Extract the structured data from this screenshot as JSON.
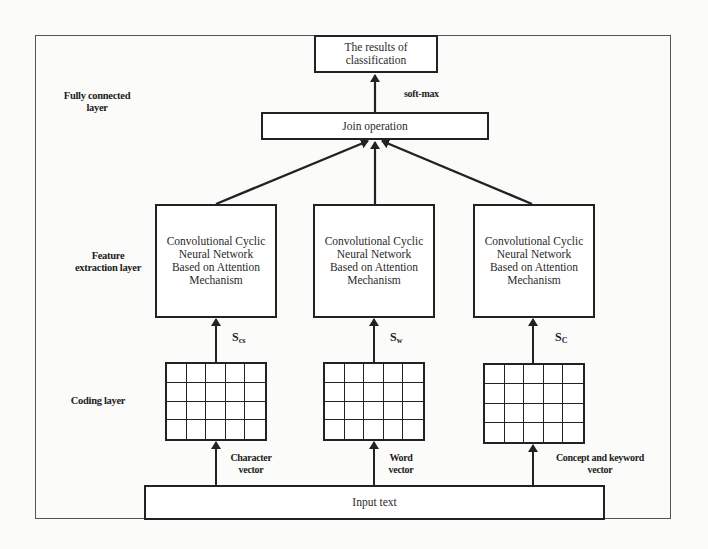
{
  "diagram": {
    "layers": {
      "fully_connected": "Fully connected layer",
      "feature_extraction": "Feature extraction layer",
      "coding": "Coding layer"
    },
    "layer_labels_lines": {
      "fully_connected": [
        "Fully connected",
        "layer"
      ],
      "feature_extraction": [
        "Feature",
        "extraction layer"
      ],
      "coding": [
        "Coding layer"
      ]
    },
    "output_box": {
      "lines": [
        "The results of",
        "classification"
      ]
    },
    "softmax_label": "soft-max",
    "join_box": {
      "label": "Join operation"
    },
    "cnn_boxes": [
      {
        "lines": [
          "Convolutional Cyclic",
          "Neural Network",
          "Based on Attention",
          "Mechanism"
        ],
        "symbol": "S",
        "symbol_sub": "cs"
      },
      {
        "lines": [
          "Convolutional Cyclic",
          "Neural Network",
          "Based on Attention",
          "Mechanism"
        ],
        "symbol": "S",
        "symbol_sub": "w"
      },
      {
        "lines": [
          "Convolutional Cyclic",
          "Neural Network",
          "Based on Attention",
          "Mechanism"
        ],
        "symbol": "S",
        "symbol_sub": "C"
      }
    ],
    "vectors": [
      {
        "lines": [
          "Character",
          "vector"
        ]
      },
      {
        "lines": [
          "Word",
          "vector"
        ]
      },
      {
        "lines": [
          "Concept and keyword",
          "vector"
        ]
      }
    ],
    "input_box": {
      "label": "Input text"
    },
    "grid": {
      "rows": 4,
      "cols": 5
    },
    "colors": {
      "stroke": "#222222",
      "frame": "#555555",
      "background": "#fbfbf9"
    }
  }
}
